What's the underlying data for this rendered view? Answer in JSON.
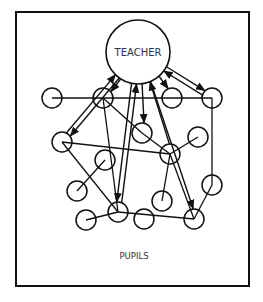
{
  "diagram": {
    "title_node": "TEACHER",
    "group_label": "PUPILS",
    "colors": {
      "stroke": "#111111",
      "background": "#ffffff",
      "text": "#333333"
    },
    "frame": {
      "x": 16,
      "y": 12,
      "width": 233,
      "height": 274
    },
    "teacher": {
      "cx": 138,
      "cy": 52,
      "r": 32
    },
    "pupil_radius": 10,
    "pupils": [
      {
        "id": "A",
        "cx": 52,
        "cy": 98
      },
      {
        "id": "B",
        "cx": 103,
        "cy": 98
      },
      {
        "id": "C",
        "cx": 172,
        "cy": 98
      },
      {
        "id": "D",
        "cx": 212,
        "cy": 98
      },
      {
        "id": "E",
        "cx": 62,
        "cy": 142
      },
      {
        "id": "F",
        "cx": 142,
        "cy": 133
      },
      {
        "id": "G",
        "cx": 198,
        "cy": 137
      },
      {
        "id": "H",
        "cx": 170,
        "cy": 154
      },
      {
        "id": "I",
        "cx": 105,
        "cy": 160
      },
      {
        "id": "J",
        "cx": 77,
        "cy": 191
      },
      {
        "id": "K",
        "cx": 212,
        "cy": 185
      },
      {
        "id": "L",
        "cx": 162,
        "cy": 201
      },
      {
        "id": "M",
        "cx": 118,
        "cy": 212
      },
      {
        "id": "N",
        "cx": 86,
        "cy": 220
      },
      {
        "id": "O",
        "cx": 144,
        "cy": 219
      },
      {
        "id": "P",
        "cx": 194,
        "cy": 219
      }
    ],
    "pupil_links": [
      [
        "A",
        "D"
      ],
      [
        "B",
        "F"
      ],
      [
        "F",
        "H"
      ],
      [
        "B",
        "M"
      ],
      [
        "E",
        "H"
      ],
      [
        "E",
        "M"
      ],
      [
        "I",
        "J"
      ],
      [
        "M",
        "N"
      ],
      [
        "M",
        "P"
      ],
      [
        "H",
        "G"
      ],
      [
        "H",
        "L"
      ],
      [
        "H",
        "P"
      ],
      [
        "D",
        "K"
      ],
      [
        "K",
        "P"
      ]
    ],
    "teacher_arrows": [
      {
        "from": "teacher",
        "to": "E",
        "dir": "down"
      },
      {
        "from": "E",
        "to": "teacher",
        "dir": "up"
      },
      {
        "from": "teacher",
        "to": "B",
        "dir": "down"
      },
      {
        "from": "M",
        "to": "teacher",
        "dir": "up"
      },
      {
        "from": "teacher",
        "to": "M",
        "dir": "down"
      },
      {
        "from": "teacher",
        "to": "F",
        "dir": "down"
      },
      {
        "from": "H",
        "to": "teacher",
        "dir": "up"
      },
      {
        "from": "teacher",
        "to": "P",
        "dir": "down"
      },
      {
        "from": "teacher",
        "to": "C",
        "dir": "down"
      },
      {
        "from": "teacher",
        "to": "D",
        "dir": "down"
      },
      {
        "from": "D",
        "to": "teacher",
        "dir": "up"
      }
    ]
  }
}
